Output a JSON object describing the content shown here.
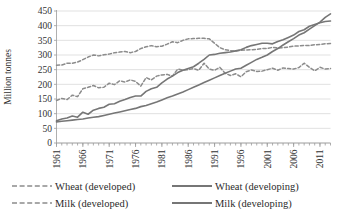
{
  "chart_data": {
    "type": "line",
    "title": "",
    "subtitle": "",
    "xlabel": "",
    "ylabel": "Million tonnes",
    "ylim": [
      0,
      450
    ],
    "ytick_step": 50,
    "yticks": [
      "0",
      "50",
      "100",
      "150",
      "200",
      "250",
      "300",
      "350",
      "400",
      "450"
    ],
    "xlim": [
      1961,
      2013
    ],
    "xticks": [
      "1961",
      "1966",
      "1971",
      "1976",
      "1981",
      "1986",
      "1991",
      "1996",
      "2001",
      "2006",
      "2011"
    ],
    "xtick_rotation": "vertical",
    "grid": "horizontal",
    "legend_position": "bottom",
    "x": [
      1961,
      1962,
      1963,
      1964,
      1965,
      1966,
      1967,
      1968,
      1969,
      1970,
      1971,
      1972,
      1973,
      1974,
      1975,
      1976,
      1977,
      1978,
      1979,
      1980,
      1981,
      1982,
      1983,
      1984,
      1985,
      1986,
      1987,
      1988,
      1989,
      1990,
      1991,
      1992,
      1993,
      1994,
      1995,
      1996,
      1997,
      1998,
      1999,
      2000,
      2001,
      2002,
      2003,
      2004,
      2005,
      2006,
      2007,
      2008,
      2009,
      2010,
      2011,
      2012,
      2013
    ],
    "series": [
      {
        "name": "Wheat (developed)",
        "style": "dashed",
        "color": "#8c8c8c",
        "values": [
          145,
          152,
          148,
          163,
          158,
          185,
          190,
          196,
          188,
          190,
          204,
          199,
          212,
          208,
          215,
          210,
          194,
          223,
          215,
          228,
          232,
          234,
          228,
          252,
          248,
          250,
          254,
          248,
          272,
          252,
          248,
          258,
          238,
          230,
          236,
          226,
          243,
          249,
          244,
          245,
          250,
          255,
          248,
          256,
          254,
          252,
          257,
          272,
          258,
          246,
          258,
          252,
          254
        ]
      },
      {
        "name": "Milk (developed)",
        "style": "dashed",
        "color": "#8c8c8c",
        "values": [
          265,
          266,
          272,
          272,
          276,
          284,
          293,
          300,
          297,
          301,
          303,
          308,
          310,
          312,
          308,
          312,
          322,
          328,
          332,
          328,
          330,
          337,
          345,
          342,
          350,
          355,
          356,
          357,
          357,
          355,
          340,
          325,
          318,
          315,
          313,
          316,
          317,
          318,
          319,
          322,
          322,
          326,
          324,
          325,
          327,
          330,
          331,
          333,
          332,
          335,
          336,
          338,
          339
        ]
      },
      {
        "name": "Wheat (developing)",
        "style": "solid",
        "color": "#767676",
        "values": [
          76,
          82,
          85,
          92,
          88,
          105,
          98,
          112,
          118,
          122,
          132,
          134,
          142,
          148,
          155,
          160,
          160,
          176,
          185,
          190,
          205,
          218,
          228,
          240,
          248,
          254,
          260,
          272,
          285,
          300,
          302,
          306,
          308,
          310,
          314,
          318,
          326,
          332,
          336,
          340,
          340,
          338,
          346,
          352,
          360,
          368,
          380,
          386,
          398,
          404,
          410,
          414,
          416
        ]
      },
      {
        "name": "Milk (developing)",
        "style": "solid",
        "color": "#767676",
        "values": [
          72,
          74,
          76,
          78,
          80,
          82,
          85,
          88,
          90,
          94,
          98,
          102,
          106,
          110,
          114,
          118,
          124,
          128,
          134,
          140,
          147,
          154,
          160,
          167,
          174,
          182,
          190,
          198,
          206,
          214,
          222,
          230,
          238,
          245,
          252,
          255,
          265,
          275,
          285,
          292,
          300,
          312,
          322,
          334,
          345,
          356,
          368,
          376,
          388,
          400,
          412,
          428,
          440
        ]
      }
    ],
    "legend": [
      {
        "label": "Wheat (developed)",
        "style": "dashed",
        "color": "#8c8c8c"
      },
      {
        "label": "Wheat (developing)",
        "style": "solid",
        "color": "#767676"
      },
      {
        "label": "Milk (developed)",
        "style": "dashed",
        "color": "#8c8c8c"
      },
      {
        "label": "Milk (developing)",
        "style": "solid",
        "color": "#767676"
      }
    ]
  }
}
